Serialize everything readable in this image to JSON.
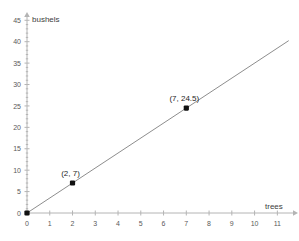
{
  "chart_data": {
    "type": "line",
    "title": "",
    "xlabel": "trees",
    "ylabel": "bushels",
    "xlim": [
      0,
      11.6
    ],
    "ylim": [
      0,
      46
    ],
    "grid": false,
    "legend": null,
    "x_ticks": [
      0,
      1,
      2,
      3,
      4,
      5,
      6,
      7,
      8,
      9,
      10,
      11
    ],
    "x_tick_labels": [
      "0",
      "1",
      "2",
      "3",
      "4",
      "5",
      "6",
      "7",
      "8",
      "9",
      "10",
      "11"
    ],
    "y_ticks": [
      0,
      5,
      10,
      15,
      20,
      25,
      30,
      35,
      40,
      45
    ],
    "y_tick_labels": [
      "0",
      "5",
      "10",
      "15",
      "20",
      "25",
      "30",
      "35",
      "40",
      "45"
    ],
    "y_minor_tick_step": 1,
    "series": [
      {
        "name": "bushels per tree",
        "type": "line",
        "slope": 3.5,
        "intercept": 0,
        "line_x": [
          0,
          11.5
        ],
        "line_y": [
          0,
          40.25
        ],
        "color": "#808080",
        "x": [
          0,
          2,
          7
        ],
        "y": [
          0,
          7,
          24.5
        ]
      }
    ],
    "points": [
      {
        "x": 0,
        "y": 0,
        "label": "",
        "marker": "square",
        "color": "#111111"
      },
      {
        "x": 2,
        "y": 7,
        "label": "(2, 7)",
        "marker": "square",
        "color": "#111111"
      },
      {
        "x": 7,
        "y": 24.5,
        "label": "(7, 24.5)",
        "marker": "square",
        "color": "#111111"
      }
    ],
    "annotations": [
      {
        "text": "(2, 7)",
        "x": 2,
        "y": 7
      },
      {
        "text": "(7, 24.5)",
        "x": 7,
        "y": 24.5
      }
    ],
    "colors": {
      "axis": "#b4b4b4",
      "line": "#808080",
      "marker": "#111111",
      "tick_text": "#5a5a5a",
      "axis_label_text": "#3d3d3d",
      "point_label_text": "#262626",
      "background": "#ffffff"
    }
  }
}
